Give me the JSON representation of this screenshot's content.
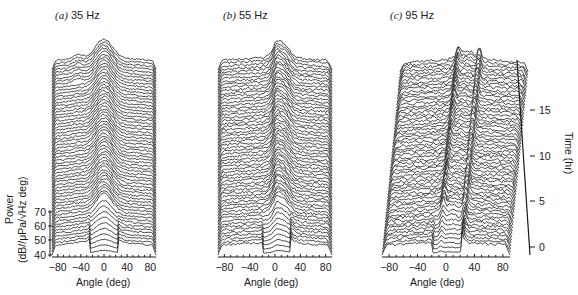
{
  "chart_data": {
    "type": "waterfall",
    "shared": {
      "xlabel": "Angle (deg)",
      "x_ticks": [
        "-80",
        "-40",
        "0",
        "40",
        "80"
      ],
      "xlim": [
        -90,
        90
      ],
      "ylabel": "Power",
      "ylabel_units": "(dB//μPa/√Hz deg)",
      "y_ticks": [
        "40",
        "50",
        "60",
        "70"
      ],
      "ylim": [
        40,
        75
      ],
      "time_label": "Time (hr)",
      "time_ticks": [
        "0",
        "5",
        "10",
        "15"
      ],
      "time_range": [
        0,
        18
      ],
      "n_traces_per_panel": 62
    },
    "panels": [
      {
        "id": "a",
        "title_prefix": "(a)",
        "title": "35 Hz",
        "peak_center_deg": 0,
        "notch_halfwidth_deg": 25,
        "peak_structure": "broad central hump, ~70 dB near 0 deg, edges ~45 dB"
      },
      {
        "id": "b",
        "title_prefix": "(b)",
        "title": "55 Hz",
        "peak_center_deg": 10,
        "notch_halfwidth_deg": 22,
        "peak_structure": "narrower central peaks between -20 and +30 deg"
      },
      {
        "id": "c",
        "title_prefix": "(c)",
        "title": "95 Hz",
        "peak_center_deg": 5,
        "notch_halfwidth_deg": 20,
        "peak_structure": "sharp spiky peaks near -10 and +25 deg"
      }
    ]
  },
  "labels": {
    "panel_a_prefix": "(a)",
    "panel_a_freq": "35 Hz",
    "panel_b_prefix": "(b)",
    "panel_b_freq": "55 Hz",
    "panel_c_prefix": "(c)",
    "panel_c_freq": "95 Hz",
    "xlabel": "Angle (deg)",
    "ylabel_power": "Power",
    "ylabel_units": "(dB//μPa/√Hz deg)",
    "time_label": "Time (hr)"
  },
  "colors": {
    "line": "#1a1a1a",
    "background": "#ffffff"
  }
}
